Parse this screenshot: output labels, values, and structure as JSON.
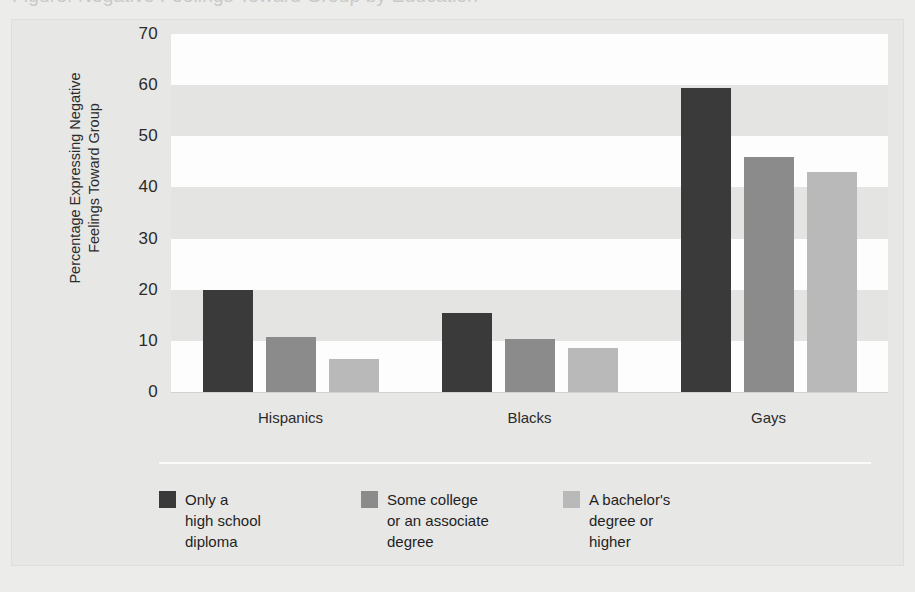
{
  "top_strip": {
    "ghost_text": "Figure: Negative Feelings Toward Group by Education"
  },
  "chart_data": {
    "type": "bar",
    "title": "",
    "subtitle": "",
    "xlabel": "",
    "ylabel": "Percentage Expressing Negative\nFeelings Toward Group",
    "ylabel_lines": [
      "Percentage Expressing Negative",
      "Feelings Toward Group"
    ],
    "categories": [
      "Hispanics",
      "Blacks",
      "Gays"
    ],
    "series": [
      {
        "name": "Only a\nhigh school\ndiploma",
        "color": "#3a3a3a",
        "values": [
          20.0,
          15.5,
          59.5
        ]
      },
      {
        "name": "Some college\nor an associate\ndegree",
        "color": "#8b8b8b",
        "values": [
          10.8,
          10.3,
          46.0
        ]
      },
      {
        "name": "A bachelor's\ndegree or\nhigher",
        "color": "#b9b9b9",
        "values": [
          6.4,
          8.7,
          43.0
        ]
      }
    ],
    "ylim": [
      0,
      70
    ],
    "ytick_step": 10,
    "yticks": [
      0,
      10,
      20,
      30,
      40,
      50,
      60,
      70
    ],
    "ytick_labels": [
      "0",
      "10",
      "20",
      "30",
      "40",
      "50",
      "60",
      "70"
    ],
    "grid": false,
    "banded_background": true,
    "band_colors": {
      "light": "#fdfdfd",
      "dark": "#e4e4e3"
    },
    "legend_position": "bottom-left",
    "legend_entries": [
      "Only a\nhigh school\ndiploma",
      "Some college\nor an associate\ndegree",
      "A bachelor's\ndegree or\nhigher"
    ]
  },
  "colors": {
    "page_background": "#ececeb",
    "panel_background": "#e7e7e6",
    "text": "#2b2b2b",
    "separator": "#fbfbfb"
  }
}
